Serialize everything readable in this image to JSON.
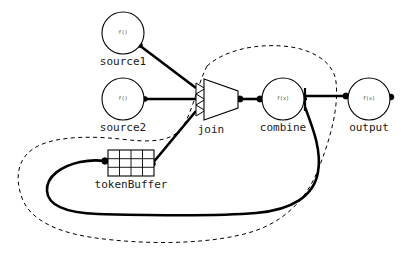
{
  "diagram": {
    "background_color": "#ffffff",
    "stroke_color": "#000000",
    "label_color": "#1a1a1a",
    "nodes": [
      {
        "id": "source1",
        "label": "source1",
        "inner_text": "f()",
        "shape": "circle",
        "cx": 123,
        "cy": 33,
        "r": 21,
        "label_x": 123,
        "label_y": 62
      },
      {
        "id": "source2",
        "label": "source2",
        "inner_text": "f()",
        "shape": "circle",
        "cx": 123,
        "cy": 99,
        "r": 21,
        "label_x": 123,
        "label_y": 128
      },
      {
        "id": "join",
        "label": "join",
        "inner_text": "",
        "shape": "trapezoid",
        "cx": 218,
        "cy": 100,
        "label_x": 211,
        "label_y": 130
      },
      {
        "id": "combine",
        "label": "combine",
        "inner_text": "f(x)",
        "shape": "circle",
        "cx": 283,
        "cy": 99,
        "r": 21,
        "label_x": 283,
        "label_y": 128
      },
      {
        "id": "output",
        "label": "output",
        "inner_text": "f(x)",
        "shape": "circle",
        "cx": 369,
        "cy": 99,
        "r": 21,
        "label_x": 369,
        "label_y": 128
      },
      {
        "id": "tokenBuffer",
        "label": "tokenBuffer",
        "inner_text": "",
        "shape": "grid",
        "x": 108,
        "y": 150,
        "width": 46,
        "height": 26,
        "columns": 4,
        "rows": 3,
        "label_x": 131,
        "label_y": 185
      }
    ],
    "edges": [
      {
        "id": "edge-source1-join",
        "from": "source1",
        "to": "join",
        "arrowhead": "open-triangle"
      },
      {
        "id": "edge-source2-join",
        "from": "source2",
        "to": "join",
        "arrowhead": "open-triangle"
      },
      {
        "id": "edge-tokenbuffer-join",
        "from": "tokenBuffer",
        "to": "join",
        "arrowhead": "open-triangle"
      },
      {
        "id": "edge-join-combine",
        "from": "join",
        "to": "combine",
        "arrowhead": "filled-dot"
      },
      {
        "id": "edge-combine-output",
        "from": "combine",
        "to": "output",
        "arrowhead": "filled-dot"
      },
      {
        "id": "edge-combine-tokenbuffer",
        "from": "combine",
        "to": "tokenBuffer",
        "arrowhead": "filled-dot"
      }
    ],
    "boundary": {
      "id": "feedback-region-boundary",
      "style": "dashed"
    }
  }
}
